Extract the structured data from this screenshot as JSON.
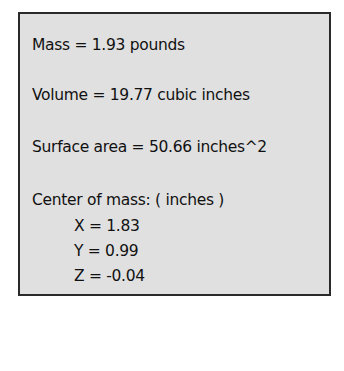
{
  "mass_properties": {
    "mass": "Mass = 1.93 pounds",
    "volume": "Volume = 19.77 cubic inches",
    "surface_area": "Surface area = 50.66 inches^2",
    "center_of_mass_label": "Center of mass: ( inches )",
    "center_of_mass": {
      "x": "X = 1.83",
      "y": "Y = 0.99",
      "z": "Z = -0.04"
    }
  }
}
